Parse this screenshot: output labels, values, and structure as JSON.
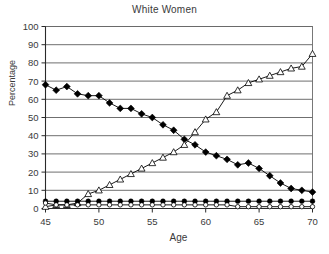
{
  "chart_data": {
    "type": "line",
    "title": "White Women",
    "xlabel": "Age",
    "ylabel": "Percentage",
    "xlim": [
      45,
      70
    ],
    "ylim": [
      0,
      100
    ],
    "xticks": [
      45,
      50,
      55,
      60,
      65,
      70
    ],
    "yticks": [
      0,
      10,
      20,
      30,
      40,
      50,
      60,
      70,
      80,
      90,
      100
    ],
    "grid": "horizontal",
    "legend": "none",
    "x": [
      45,
      46,
      47,
      48,
      49,
      50,
      51,
      52,
      53,
      54,
      55,
      56,
      57,
      58,
      59,
      60,
      61,
      62,
      63,
      64,
      65,
      66,
      67,
      68,
      69,
      70
    ],
    "series": [
      {
        "name": "declining-series",
        "marker": "filled-diamond",
        "values": [
          68,
          65,
          67,
          63,
          62,
          62,
          58,
          55,
          55,
          52,
          50,
          46,
          43,
          38,
          35,
          31,
          29,
          27,
          24,
          25,
          22,
          18,
          14,
          11,
          10,
          9
        ]
      },
      {
        "name": "rising-series",
        "marker": "open-triangle",
        "values": [
          1,
          2,
          2,
          3,
          8,
          10,
          13,
          16,
          19,
          22,
          25,
          28,
          31,
          35,
          42,
          49,
          53,
          62,
          65,
          69,
          71,
          73,
          75,
          77,
          78,
          85
        ]
      },
      {
        "name": "low-flat-series-filled",
        "marker": "filled-circle",
        "values": [
          4,
          4,
          4,
          4,
          4,
          4,
          4,
          4,
          4,
          4,
          4,
          4,
          4,
          4,
          4,
          4,
          4,
          4,
          4,
          4,
          4,
          4,
          4,
          4,
          4,
          4
        ]
      },
      {
        "name": "low-flat-series-open",
        "marker": "open-circle",
        "values": [
          3,
          2,
          2,
          2,
          2,
          2,
          2,
          2,
          2,
          2,
          2,
          2,
          2,
          2,
          2,
          2,
          2,
          2,
          1,
          1,
          1,
          1,
          1,
          1,
          1,
          1
        ]
      }
    ]
  },
  "axes": {
    "y_tick_labels": [
      "100",
      "90",
      "80",
      "70",
      "60",
      "50",
      "40",
      "30",
      "20",
      "10",
      "0"
    ],
    "x_tick_labels": [
      "45",
      "50",
      "55",
      "60",
      "65",
      "70"
    ]
  }
}
